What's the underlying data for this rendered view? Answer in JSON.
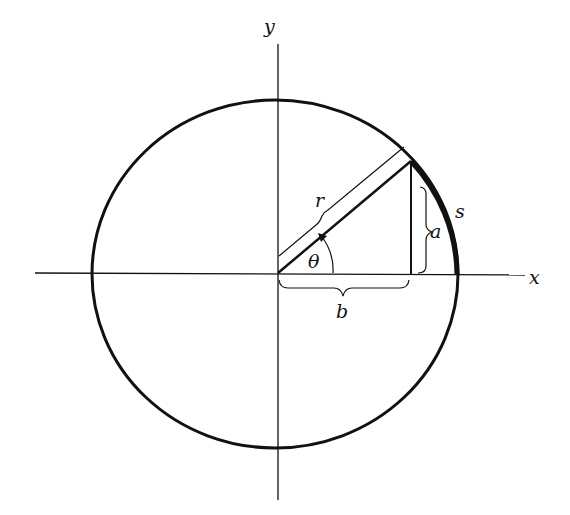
{
  "diagram": {
    "type": "unit-circle-arc-diagram",
    "labels": {
      "y_axis": "y",
      "x_axis": "x",
      "radius": "r",
      "opposite": "a",
      "adjacent": "b",
      "angle": "θ",
      "arc": "s"
    },
    "colors": {
      "stroke": "#111111",
      "background": "#ffffff"
    }
  }
}
